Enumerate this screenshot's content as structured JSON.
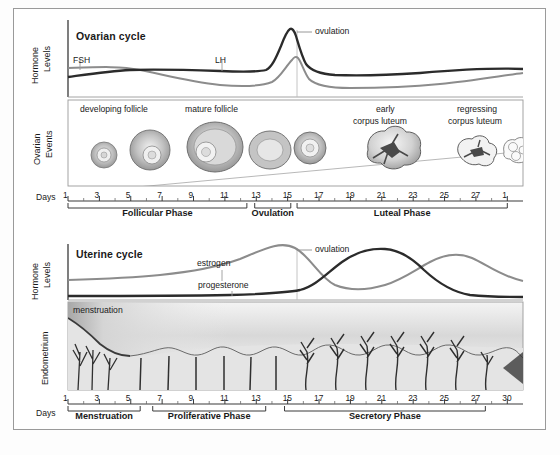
{
  "figure": {
    "title_ovarian": "Ovarian cycle",
    "title_uterine": "Uterine cycle",
    "axis_label_hormone": "Hormone\nLevels",
    "axis_label_hormone_line1": "Hormone",
    "axis_label_hormone_line2": "Levels",
    "axis_label_ovarian_events_line1": "Ovarian",
    "axis_label_ovarian_events_line2": "Events",
    "axis_label_endometrium": "Endometrium",
    "days_label": "Days"
  },
  "ovarian_hormones": {
    "curves": [
      {
        "name": "FSH",
        "label": "FSH",
        "color": "#8c8c8c",
        "label_x": 72,
        "label_y": 63
      },
      {
        "name": "LH",
        "label": "LH",
        "color": "#2b2b2b",
        "label_x": 215,
        "label_y": 63
      }
    ],
    "ovulation_label": "ovulation",
    "ovulation_day": 14
  },
  "ovarian_events": {
    "labels": [
      {
        "text": "developing follicle",
        "x": 128,
        "y": 110
      },
      {
        "text": "mature follicle",
        "x": 222,
        "y": 110
      },
      {
        "text": "early",
        "line2": "corpus luteum",
        "x": 392,
        "y": 110
      },
      {
        "text": "regressing",
        "line2": "corpus luteum",
        "x": 480,
        "y": 110
      }
    ],
    "structures": [
      {
        "name": "primordial-follicle",
        "day": 2
      },
      {
        "name": "primary-follicle",
        "day": 5
      },
      {
        "name": "graafian-follicle",
        "day": 9
      },
      {
        "name": "ruptured-follicle",
        "day": 13
      },
      {
        "name": "ovulated-oocyte",
        "day": 15
      },
      {
        "name": "early-corpus-luteum",
        "day": 20
      },
      {
        "name": "regressing-corpus-luteum",
        "day": 25
      },
      {
        "name": "corpus-albicans",
        "day": 28
      }
    ]
  },
  "ovarian_axis": {
    "ticks": [
      1,
      3,
      5,
      7,
      9,
      11,
      13,
      15,
      17,
      19,
      21,
      23,
      25,
      27,
      1
    ],
    "tick_labels": [
      "1",
      "3",
      "5",
      "7",
      "9",
      "11",
      "13",
      "15",
      "17",
      "19",
      "21",
      "23",
      "25",
      "27",
      "1"
    ],
    "phases": [
      {
        "label": "Follicular Phase",
        "start_day": 1,
        "end_day": 12.4
      },
      {
        "label": "Ovulation",
        "start_day": 12.9,
        "end_day": 15.2
      },
      {
        "label": "Luteal Phase",
        "start_day": 15.6,
        "end_day": 29
      }
    ]
  },
  "uterine_hormones": {
    "curves": [
      {
        "name": "estrogen",
        "label": "estrogen",
        "color": "#8c8c8c",
        "label_x": 196,
        "label_y": 268
      },
      {
        "name": "progesterone",
        "label": "progesterone",
        "color": "#2b2b2b",
        "label_x": 205,
        "label_y": 290
      }
    ],
    "ovulation_label": "ovulation",
    "ovulation_day": 14
  },
  "endometrium": {
    "label": "menstruation"
  },
  "uterine_axis": {
    "ticks": [
      1,
      3,
      5,
      7,
      9,
      11,
      13,
      15,
      17,
      19,
      21,
      23,
      25,
      27,
      30
    ],
    "tick_labels": [
      "1",
      "3",
      "5",
      "7",
      "9",
      "11",
      "13",
      "15",
      "17",
      "19",
      "21",
      "23",
      "25",
      "27",
      "30"
    ],
    "phases": [
      {
        "label": "Menstruation",
        "start_day": 1,
        "end_day": 5.6
      },
      {
        "label": "Proliferative Phase",
        "start_day": 6.4,
        "end_day": 13.6
      },
      {
        "label": "Secretory Phase",
        "start_day": 14.8,
        "end_day": 27.6
      }
    ]
  },
  "colors": {
    "dark_curve": "#2b2b2b",
    "light_curve": "#8c8c8c",
    "frame": "#9a9a9a",
    "axis": "#3a3a3a",
    "background": "#ffffff"
  }
}
